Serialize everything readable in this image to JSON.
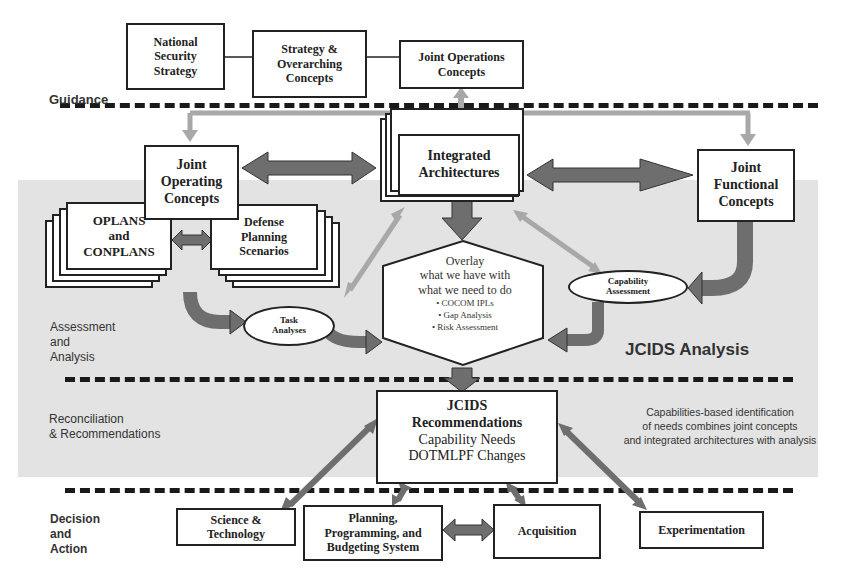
{
  "lanes": {
    "guidance": "Guidance",
    "assessment": "Assessment\nand\nAnalysis",
    "reconciliation": "Reconciliation\n& Recommendations",
    "decision": "Decision\nand\nAction"
  },
  "guidance_boxes": {
    "national_security_strategy": "National\nSecurity\nStrategy",
    "strategy_overarching": "Strategy &\nOverarching\nConcepts",
    "joint_operations_concepts": "Joint Operations\nConcepts"
  },
  "concept_boxes": {
    "joint_operating_concepts": "Joint\nOperating\nConcepts",
    "integrated_architectures": "Integrated\nArchitectures",
    "joint_functional_concepts": "Joint\nFunctional\nConcepts",
    "oplans_conplans": "OPLANS\nand\nCONPLANS",
    "defense_planning_scenarios": "Defense\nPlanning\nScenarios"
  },
  "ellipses": {
    "task_analyses": "Task\nAnalyses",
    "capability_assessment": "Capability\nAssessment"
  },
  "overlay": {
    "title": "Overlay",
    "line1": "what we have with",
    "line2": "what we need to do",
    "bullets": [
      "• COCOM IPLs",
      "• Gap Analysis",
      "• Risk Assessment"
    ]
  },
  "analysis_label": "JCIDS Analysis",
  "recommendations": {
    "line1": "JCIDS",
    "line2": "Recommendations",
    "line3": "Capability Needs",
    "line4": "DOTMLPF Changes"
  },
  "caption": "Capabilities-based identification\nof needs combines joint concepts\nand integrated architectures with analysis",
  "action_boxes": {
    "science_technology": "Science &\nTechnology",
    "ppbs": "Planning,\nProgramming, and\nBudgeting System",
    "acquisition": "Acquisition",
    "experimentation": "Experimentation"
  },
  "colors": {
    "band": "#e3e3e3",
    "arrow_dark": "#6e6e6e",
    "arrow_light": "#a8a8a8",
    "border": "#222222"
  }
}
